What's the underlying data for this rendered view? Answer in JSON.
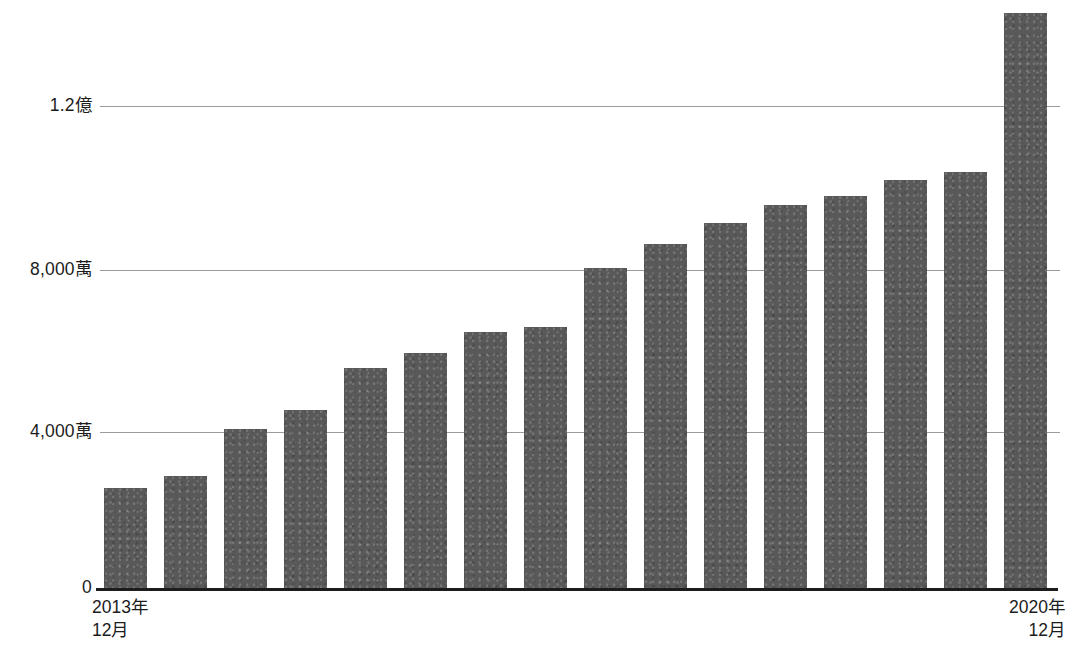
{
  "chart_data": {
    "type": "bar",
    "title": "",
    "subtitle": "",
    "xlabel": "",
    "ylabel": "",
    "categories": [
      "2013年12月",
      "2014年6月",
      "2014年12月",
      "2015年6月",
      "2015年12月",
      "2016年6月",
      "2016年12月",
      "2017年6月",
      "2017年12月",
      "2018年6月",
      "2018年12月",
      "2019年6月",
      "2019年12月",
      "2020年3月",
      "2020年6月",
      "2020年12月"
    ],
    "values": [
      24800000,
      27600000,
      39300000,
      44000000,
      54400000,
      58100000,
      63300000,
      64400000,
      79000000,
      85000000,
      90200000,
      94600000,
      96900000,
      100800000,
      102600000,
      142000000
    ],
    "ylim": [
      0,
      142000000
    ],
    "ytick_values": [
      0,
      40000000,
      80000000,
      120000000
    ],
    "ytick_labels": [
      "0",
      "4,000萬",
      "8,000萬",
      "1.2億"
    ],
    "xtick_labels": [
      {
        "line1": "2013年",
        "line2": "12月",
        "align": "left"
      },
      {
        "line1": "2020年",
        "line2": "12月",
        "align": "right"
      }
    ],
    "grid": true,
    "legend": null,
    "series_name": "",
    "bar_color": "#595959",
    "gridline_color": "#9b9b9b",
    "axis_color": "#1c1c1c",
    "background_color": "#ffffff"
  }
}
